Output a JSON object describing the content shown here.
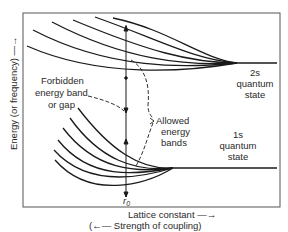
{
  "diagram": {
    "y_axis_label": "Energy (or frequency) —→",
    "x_axis_label": "Lattice constant —→",
    "x_axis_sublabel": "(←— Strength of coupling)",
    "r0_label": "r",
    "r0_subscript": "0",
    "forbidden_label": [
      "Forbidden",
      "energy band",
      "or gap"
    ],
    "allowed_label": [
      "Allowed",
      "energy",
      "bands"
    ],
    "state_2s": [
      "2s",
      "quantum",
      "state"
    ],
    "state_1s": [
      "1s",
      "quantum",
      "state"
    ],
    "colors": {
      "line": "#1a1a1a",
      "frame": "#555555",
      "text": "#2a2a2a",
      "background": "#ffffff"
    }
  }
}
